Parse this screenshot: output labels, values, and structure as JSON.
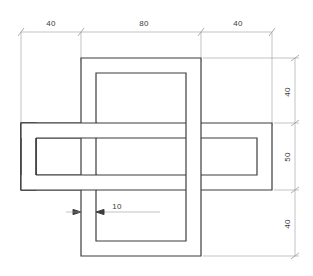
{
  "drawing": {
    "title": "Interlocking frames orthographic view",
    "line_color": "#3c3c3c",
    "dim_color": "#9a9a9a",
    "text_color": "#3a3a3a",
    "background": "#ffffff",
    "wall_thickness_note": "10"
  },
  "dimensions": {
    "top_chain": [
      {
        "value": "40",
        "x": 51,
        "y": 26
      },
      {
        "value": "80",
        "x": 149,
        "y": 26
      },
      {
        "value": "40",
        "x": 238,
        "y": 26
      }
    ],
    "right_chain": [
      {
        "value": "40",
        "x": 292,
        "y": 92
      },
      {
        "value": "50",
        "x": 292,
        "y": 157
      },
      {
        "value": "40",
        "x": 292,
        "y": 224
      }
    ],
    "leader": {
      "value": "10",
      "x": 117,
      "y": 215
    }
  },
  "geometry": {
    "vertical_frame": {
      "outer": {
        "x": 81,
        "y": 58,
        "width": 120,
        "height": 198
      },
      "inner": {
        "x": 96,
        "y": 73,
        "width": 90,
        "height": 168
      }
    },
    "horizontal_frame": {
      "outer": {
        "x": 21,
        "y": 123,
        "width": 251,
        "height": 67
      },
      "inner": {
        "x": 36,
        "y": 138,
        "width": 221,
        "height": 37
      }
    }
  }
}
